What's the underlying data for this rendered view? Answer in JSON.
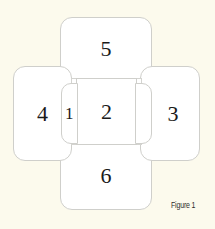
{
  "figure": {
    "caption": "Figure 1",
    "background_color": "#fcfaed",
    "panel_fill": "#ffffff",
    "panel_border": "#cfcfcb",
    "panels": [
      {
        "id": "1",
        "label": "1",
        "position": "left-inner-flap"
      },
      {
        "id": "2",
        "label": "2",
        "position": "center"
      },
      {
        "id": "3",
        "label": "3",
        "position": "right"
      },
      {
        "id": "4",
        "label": "4",
        "position": "left"
      },
      {
        "id": "5",
        "label": "5",
        "position": "top"
      },
      {
        "id": "6",
        "label": "6",
        "position": "bottom"
      }
    ]
  }
}
